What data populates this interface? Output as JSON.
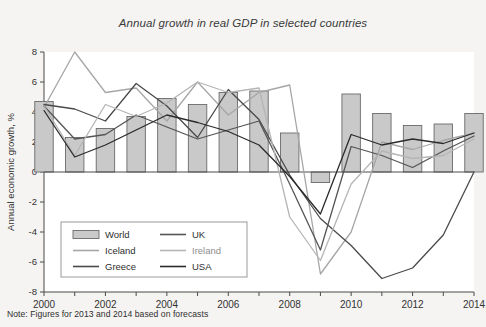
{
  "chart_data": {
    "type": "bar",
    "title": "Annual growth in real GDP in selected countries",
    "xlabel": "",
    "ylabel": "Annual economic growth, %",
    "xlim": [
      2000,
      2014
    ],
    "ylim": [
      -8,
      8
    ],
    "yticks": [
      8,
      6,
      4,
      2,
      0,
      -2,
      -4,
      -6,
      -8
    ],
    "ytick_labels": [
      "8",
      "6",
      "4",
      "2",
      "0",
      "-2",
      "-4",
      "-6",
      "-8"
    ],
    "xticks": [
      2000,
      2001,
      2002,
      2003,
      2004,
      2005,
      2006,
      2007,
      2008,
      2009,
      2010,
      2011,
      2012,
      2013,
      2014
    ],
    "xtick_labels": [
      "2000",
      "",
      "2002",
      "",
      "2004",
      "",
      "2006",
      "",
      "2008",
      "",
      "2010",
      "",
      "2012",
      "",
      "2014"
    ],
    "categories": [
      2000,
      2001,
      2002,
      2003,
      2004,
      2005,
      2006,
      2007,
      2008,
      2009,
      2010,
      2011,
      2012,
      2013,
      2014
    ],
    "grid": false,
    "legend_position": "lower-left",
    "note": "Note: Figures for 2013 and 2014 based on forecasts",
    "series": [
      {
        "name": "World",
        "kind": "bar",
        "color": "#c9c9c9",
        "edge_color": "#6a6a6a",
        "values": [
          4.7,
          2.3,
          2.9,
          3.7,
          4.9,
          4.5,
          5.3,
          5.4,
          2.6,
          -0.7,
          5.2,
          3.9,
          3.1,
          3.2,
          3.9
        ]
      },
      {
        "name": "Iceland",
        "kind": "line",
        "color": "#a6a6a6",
        "values": [
          4.3,
          8.0,
          5.3,
          5.6,
          3.4,
          6.0,
          3.8,
          5.3,
          5.8,
          -6.8,
          -4.0,
          2.0,
          1.5,
          2.1,
          2.6
        ]
      },
      {
        "name": "Greece",
        "kind": "line",
        "color": "#4a4a4a",
        "values": [
          4.5,
          4.2,
          3.4,
          5.9,
          4.4,
          2.3,
          5.5,
          3.5,
          -0.2,
          -3.1,
          -4.9,
          -7.1,
          -6.4,
          -4.2,
          0.0
        ]
      },
      {
        "name": "UK",
        "kind": "line",
        "color": "#555555",
        "values": [
          4.4,
          2.2,
          2.5,
          3.8,
          3.0,
          2.2,
          2.8,
          3.4,
          -0.8,
          -5.2,
          1.7,
          1.1,
          0.3,
          1.4,
          2.4
        ]
      },
      {
        "name": "Ireland",
        "kind": "line",
        "color": "#b5b5b5",
        "values": [
          4.4,
          1.1,
          4.5,
          3.7,
          4.6,
          6.0,
          5.3,
          5.6,
          -3.0,
          -5.9,
          -0.8,
          1.4,
          0.9,
          1.1,
          2.2
        ]
      },
      {
        "name": "USA",
        "kind": "line",
        "color": "#2b2b2b",
        "values": [
          4.1,
          1.0,
          1.8,
          2.8,
          3.8,
          3.3,
          2.7,
          1.8,
          -0.3,
          -2.8,
          2.5,
          1.8,
          2.2,
          1.9,
          2.6
        ]
      }
    ]
  },
  "legend": {
    "entries": [
      {
        "label": "World",
        "type": "bar"
      },
      {
        "label": "UK",
        "type": "line"
      },
      {
        "label": "Iceland",
        "type": "line"
      },
      {
        "label": "Ireland",
        "type": "line"
      },
      {
        "label": "Greece",
        "type": "line"
      },
      {
        "label": "USA",
        "type": "line"
      }
    ]
  },
  "footnote": {
    "text": "Note: Figures for 2013 and 2014 based on forecasts"
  }
}
